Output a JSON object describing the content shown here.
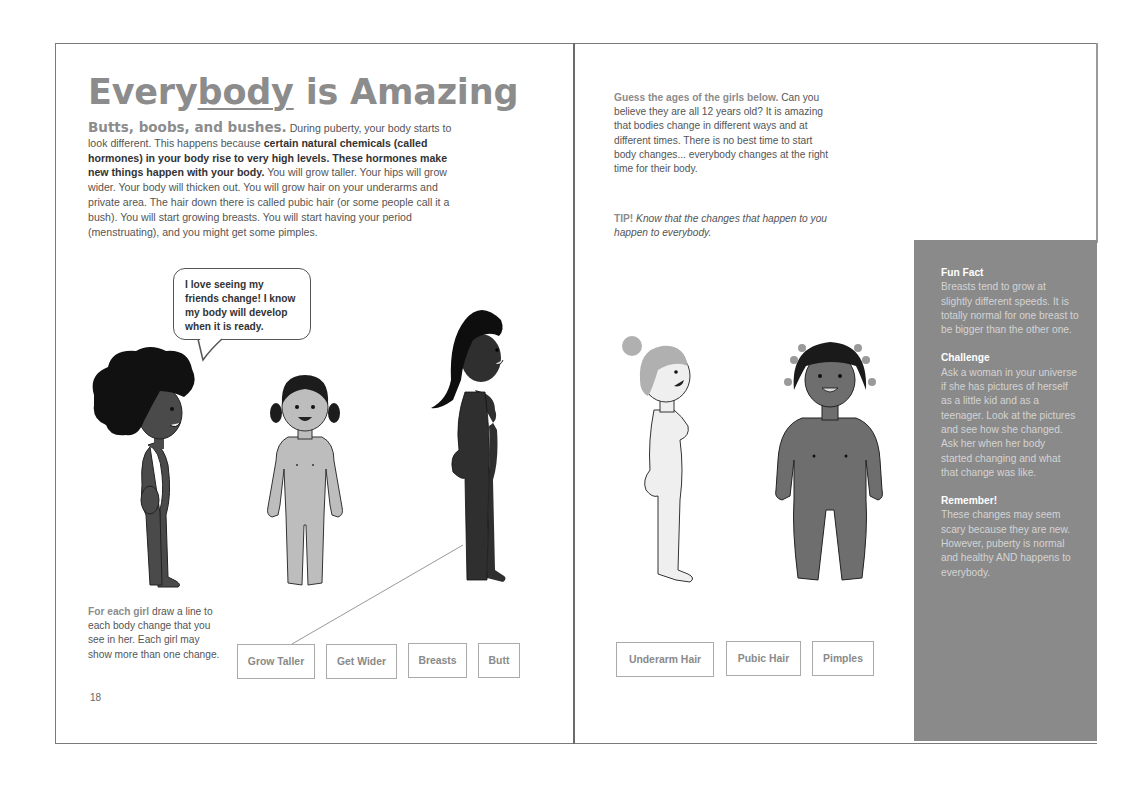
{
  "left_page": {
    "title_prefix": "Every",
    "title_underlined": "body",
    "title_suffix": " is Amazing",
    "intro": {
      "lead": "Butts, boobs, and bushes.",
      "text1": " During puberty, your body starts to look different. This happens because ",
      "bold": "certain natural chemicals (called hormones) in your body rise to very high levels. These hormones make new things happen with your body.",
      "text2": " You will grow taller. Your hips will grow wider. Your body will thicken out. You will grow hair on your underarms and private area. The hair down there is called pubic hair (or some people call it a bush). You will start growing breasts. You will start having your period (menstruating), and you might get some pimples."
    },
    "speech_bubble": "I love seeing my friends change! I know my body will develop when it is ready.",
    "instructions": {
      "lead": "For each girl",
      "text": " draw a line to each body change that you see in her. Each girl may show more than one change."
    },
    "choices": [
      "Grow Taller",
      "Get Wider",
      "Breasts",
      "Butt"
    ],
    "page_number": "18",
    "figures": [
      {
        "name": "girl-curly-hair-side",
        "skin": "#4a4a4a",
        "hair": "#111111"
      },
      {
        "name": "girl-pigtails-front",
        "skin": "#bdbdbd",
        "hair": "#1c1c1c"
      },
      {
        "name": "girl-long-hair-side",
        "skin": "#2f2f2f",
        "hair": "#0e0e0e"
      }
    ]
  },
  "right_page": {
    "text": {
      "lead": "Guess the ages of the girls below.",
      "body": " Can you believe they are all 12 years old? It is amazing that bodies change in different ways and at different times. There is no best time to start body changes... everybody changes at the right time for their body."
    },
    "tip": {
      "lead": "TIP!",
      "body": " Know that the changes that happen to you happen to everybody."
    },
    "choices": [
      "Underarm Hair",
      "Pubic Hair",
      "Pimples"
    ],
    "figures": [
      {
        "name": "girl-bun-side",
        "skin": "#efefef",
        "hair": "#b0b0b0"
      },
      {
        "name": "girl-beaded-hair-front",
        "skin": "#6e6e6e",
        "hair": "#1a1a1a"
      }
    ],
    "sidebar": {
      "fun_fact_title": "Fun Fact",
      "fun_fact": "Breasts tend to grow at slightly different speeds. It is totally normal for one breast to be bigger than the other one.",
      "challenge_title": "Challenge",
      "challenge": "Ask a woman in your universe if she has pictures of herself as a little kid and as a teenager. Look at the pictures and see how she changed. Ask her when her body started changing and what that change was like.",
      "remember_title": "Remember!",
      "remember": "These changes may seem scary because they are new. However, puberty is normal and healthy AND happens to everybody."
    }
  },
  "colors": {
    "heading_gray": "#8c8c8c",
    "sidebar_bg": "#8a8a8a",
    "border": "#7a7a7a"
  }
}
